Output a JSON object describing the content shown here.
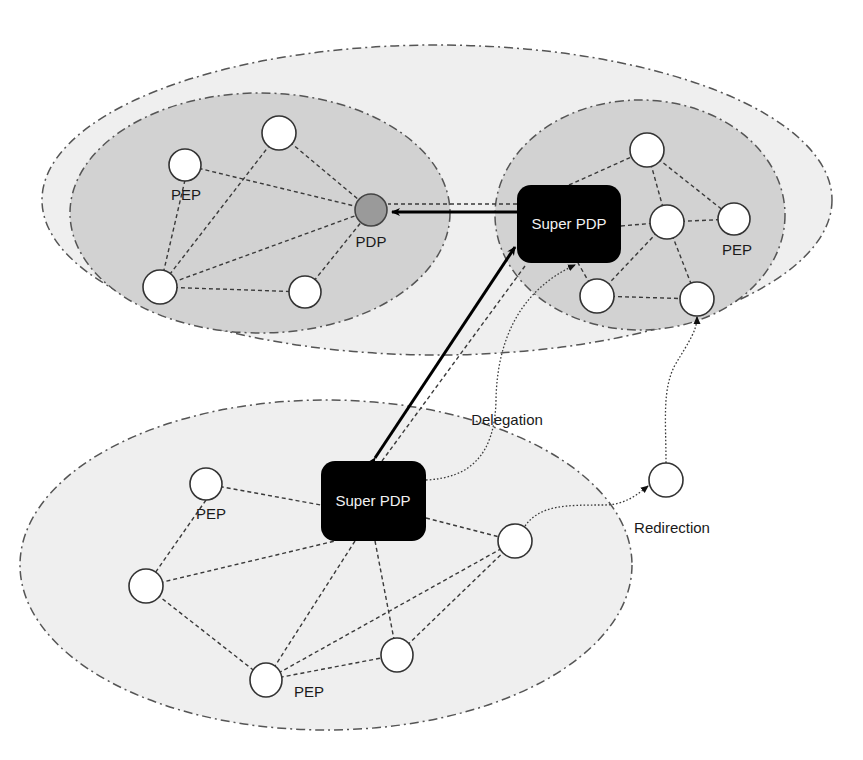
{
  "diagram": {
    "colors": {
      "outer_zone_fill": "#efefef",
      "inner_zone_fill": "#d2d2d2",
      "pdp_fill": "#9a9a9a",
      "super_pdp_fill": "#000000",
      "node_fill": "#ffffff",
      "edge": "#3a3a3a"
    },
    "zones": [
      {
        "id": "top-outer",
        "cx": 437,
        "cy": 200,
        "rx": 395,
        "ry": 155,
        "fill": "#efefef"
      },
      {
        "id": "bottom",
        "cx": 326,
        "cy": 565,
        "rx": 306,
        "ry": 165,
        "fill": "#efefef"
      },
      {
        "id": "top-left-inner",
        "cx": 260,
        "cy": 213,
        "rx": 190,
        "ry": 120,
        "fill": "#d2d2d2"
      },
      {
        "id": "top-right-inner",
        "cx": 640,
        "cy": 215,
        "rx": 145,
        "ry": 115,
        "fill": "#d2d2d2"
      }
    ],
    "super_pdps": [
      {
        "id": "sp-top",
        "x": 517,
        "y": 185,
        "w": 104,
        "h": 78,
        "label": "Super PDP"
      },
      {
        "id": "sp-bottom",
        "x": 321,
        "y": 461,
        "w": 105,
        "h": 80,
        "label": "Super PDP"
      }
    ],
    "nodes": [
      {
        "id": "tl1",
        "x": 279,
        "y": 133
      },
      {
        "id": "tl2",
        "x": 185,
        "y": 165
      },
      {
        "id": "tl3",
        "x": 160,
        "y": 287
      },
      {
        "id": "tl4",
        "x": 305,
        "y": 292
      },
      {
        "id": "tr1",
        "x": 647,
        "y": 150
      },
      {
        "id": "tr2",
        "x": 667,
        "y": 222
      },
      {
        "id": "tr3",
        "x": 734,
        "y": 219
      },
      {
        "id": "tr4",
        "x": 597,
        "y": 296
      },
      {
        "id": "tr5",
        "x": 697,
        "y": 299
      },
      {
        "id": "b1",
        "x": 206,
        "y": 484
      },
      {
        "id": "b2",
        "x": 146,
        "y": 586
      },
      {
        "id": "b3",
        "x": 266,
        "y": 680
      },
      {
        "id": "b4",
        "x": 397,
        "y": 655
      },
      {
        "id": "b5",
        "x": 515,
        "y": 541
      },
      {
        "id": "iso",
        "x": 666,
        "y": 480
      }
    ],
    "pdp": {
      "id": "pdp",
      "x": 371,
      "y": 210,
      "label": "PDP"
    },
    "labels": [
      {
        "text": "PEP",
        "x": 186,
        "y": 200
      },
      {
        "text": "PDP",
        "x": 371,
        "y": 247
      },
      {
        "text": "PEP",
        "x": 737,
        "y": 255
      },
      {
        "text": "PEP",
        "x": 211,
        "y": 519
      },
      {
        "text": "PEP",
        "x": 309,
        "y": 697
      },
      {
        "text": "Delegation",
        "x": 507,
        "y": 425
      },
      {
        "text": "Redirection",
        "x": 672,
        "y": 533
      }
    ],
    "legend_text": {
      "delegation": "Delegation",
      "redirection": "Redirection",
      "pep": "PEP",
      "pdp": "PDP",
      "super_pdp": "Super PDP"
    }
  }
}
